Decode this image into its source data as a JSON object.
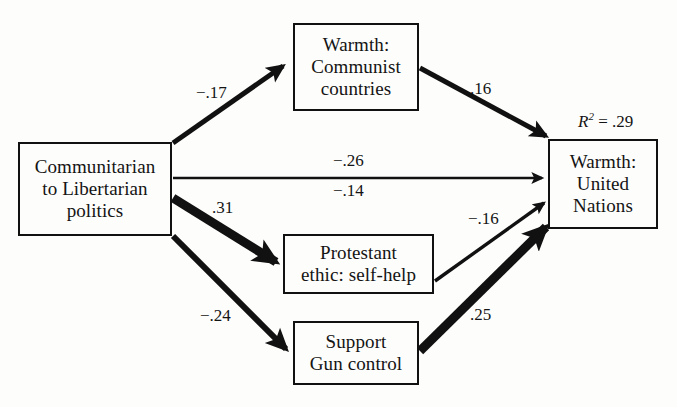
{
  "figure": {
    "type": "path-diagram",
    "title": "",
    "background_color": "#fdfdfb",
    "line_color": "#111111",
    "text_color": "#141414"
  },
  "nodes": {
    "predictor": {
      "id": "communitarian-libertarian-politics",
      "lines": [
        "Communitarian",
        "to Libertarian",
        "politics"
      ],
      "x": 18,
      "y": 142,
      "w": 154,
      "h": 94
    },
    "mediator_communist": {
      "id": "warmth-communist-countries",
      "lines": [
        "Warmth:",
        "Communist",
        "countries"
      ],
      "x": 293,
      "y": 23,
      "w": 126,
      "h": 88
    },
    "mediator_protestant": {
      "id": "protestant-ethic-self-help",
      "lines": [
        "Protestant",
        "ethic: self-help"
      ],
      "x": 283,
      "y": 234,
      "w": 151,
      "h": 60
    },
    "mediator_gun": {
      "id": "support-gun-control",
      "lines": [
        "Support",
        "Gun control"
      ],
      "x": 293,
      "y": 321,
      "w": 126,
      "h": 64
    },
    "outcome": {
      "id": "warmth-united-nations",
      "lines": [
        "Warmth:",
        "United",
        "Nations"
      ],
      "x": 548,
      "y": 139,
      "w": 110,
      "h": 90
    }
  },
  "annotations": {
    "r2": {
      "symbol": "R",
      "superscript": "2",
      "rest": " = .29",
      "full_text": "R2 = .29",
      "value": 0.29,
      "x": 578,
      "y": 113
    }
  },
  "edges": [
    {
      "id": "politics-to-communist",
      "from": "Communitarian to Libertarian politics",
      "to": "Warmth: Communist countries",
      "coefficient": "−.17",
      "value": -0.17,
      "stroke_width": 5,
      "label_x": 196,
      "label_y": 84
    },
    {
      "id": "communist-to-un",
      "from": "Warmth: Communist countries",
      "to": "Warmth: United Nations",
      "coefficient": ".16",
      "value": 0.16,
      "stroke_width": 5,
      "label_x": 470,
      "label_y": 80
    },
    {
      "id": "politics-to-un-direct-1",
      "from": "Communitarian to Libertarian politics",
      "to": "Warmth: United Nations",
      "coefficient": "−.26",
      "value": -0.26,
      "stroke_width": 2.5,
      "label_x": 333,
      "label_y": 152
    },
    {
      "id": "politics-to-un-direct-2",
      "from": "Communitarian to Libertarian politics",
      "to": "Warmth: United Nations",
      "coefficient": "−.14",
      "value": -0.14,
      "stroke_width": 2.5,
      "label_x": 333,
      "label_y": 182
    },
    {
      "id": "politics-to-protestant",
      "from": "Communitarian to Libertarian politics",
      "to": "Protestant ethic: self-help",
      "coefficient": ".31",
      "value": 0.31,
      "stroke_width": 9,
      "label_x": 212,
      "label_y": 199
    },
    {
      "id": "protestant-to-un",
      "from": "Protestant ethic: self-help",
      "to": "Warmth: United Nations",
      "coefficient": "−.16",
      "value": -0.16,
      "stroke_width": 3.5,
      "label_x": 468,
      "label_y": 210
    },
    {
      "id": "politics-to-gun",
      "from": "Communitarian to Libertarian politics",
      "to": "Support Gun control",
      "coefficient": "−.24",
      "value": -0.24,
      "stroke_width": 6,
      "label_x": 200,
      "label_y": 307
    },
    {
      "id": "gun-to-un",
      "from": "Support Gun control",
      "to": "Warmth: United Nations",
      "coefficient": ".25",
      "value": 0.25,
      "stroke_width": 9,
      "label_x": 470,
      "label_y": 306
    }
  ]
}
